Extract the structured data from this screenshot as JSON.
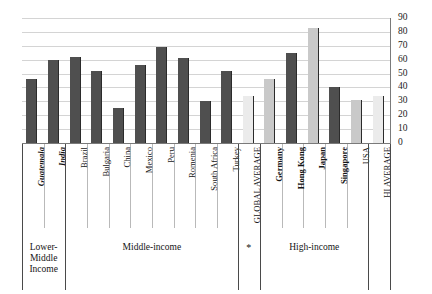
{
  "chart_data": {
    "type": "bar",
    "title": "",
    "xlabel": "",
    "ylabel": "",
    "ylim": [
      0,
      90
    ],
    "ytick_step": 10,
    "yticks": [
      90,
      80,
      70,
      60,
      50,
      40,
      30,
      20,
      10,
      0
    ],
    "grid": true,
    "legend": "none",
    "categories": [
      "Guatemala",
      "India",
      "Brazil",
      "Bulgaria",
      "China",
      "Mexico",
      "Peru",
      "Romenia",
      "South Africa",
      "Turkey",
      "GLOBAL AVERAGE",
      "Germany",
      "Hong Kong",
      "Japan",
      "Singapore",
      "USA",
      "HI AVERAGE"
    ],
    "values": [
      46,
      60,
      62,
      52,
      25,
      56,
      69,
      61,
      30,
      52,
      34,
      46,
      65,
      83,
      40,
      31,
      34
    ],
    "bars": [
      {
        "label": "Guatemala",
        "value": 46,
        "shade": "dark",
        "label_style": "bold-italic"
      },
      {
        "label": "India",
        "value": 60,
        "shade": "dark",
        "label_style": "bold-italic"
      },
      {
        "label": "Brazil",
        "value": 62,
        "shade": "dark",
        "label_style": "normal"
      },
      {
        "label": "Bulgaria",
        "value": 52,
        "shade": "dark",
        "label_style": "normal"
      },
      {
        "label": "China",
        "value": 25,
        "shade": "dark",
        "label_style": "normal"
      },
      {
        "label": "Mexico",
        "value": 56,
        "shade": "dark",
        "label_style": "normal"
      },
      {
        "label": "Peru",
        "value": 69,
        "shade": "dark",
        "label_style": "normal"
      },
      {
        "label": "Romenia",
        "value": 61,
        "shade": "dark",
        "label_style": "normal"
      },
      {
        "label": "South Africa",
        "value": 30,
        "shade": "dark",
        "label_style": "normal"
      },
      {
        "label": "Turkey",
        "value": 52,
        "shade": "dark",
        "label_style": "normal"
      },
      {
        "label": "GLOBAL AVERAGE",
        "value": 34,
        "shade": "vlight",
        "label_style": "normal"
      },
      {
        "label": "Germany",
        "value": 46,
        "shade": "light",
        "label_style": "bold"
      },
      {
        "label": "Hong Kong",
        "value": 65,
        "shade": "dark",
        "label_style": "bold"
      },
      {
        "label": "Japan",
        "value": 83,
        "shade": "light",
        "label_style": "bold"
      },
      {
        "label": "Singapore",
        "value": 40,
        "shade": "dark",
        "label_style": "bold"
      },
      {
        "label": "USA",
        "value": 31,
        "shade": "light",
        "label_style": "normal"
      },
      {
        "label": "HI AVERAGE",
        "value": 34,
        "shade": "vlight",
        "label_style": "normal"
      }
    ],
    "groups": [
      {
        "label": "Lower-\nMiddle\nIncome",
        "lines": [
          "Lower-",
          "Middle",
          "Income"
        ],
        "start": 0,
        "end": 1
      },
      {
        "label": "Middle-income",
        "lines": [
          "Middle-income"
        ],
        "start": 2,
        "end": 9
      },
      {
        "label": "High-income",
        "lines": [
          "High-income"
        ],
        "start": 11,
        "end": 15
      }
    ],
    "annotations": [
      {
        "text": "*",
        "near": "GLOBAL AVERAGE"
      }
    ],
    "colors": {
      "bar_dark": "#4f4f4f",
      "bar_light": "#c9c9c9",
      "bar_very_light": "#ebebeb",
      "bar_edge": "#2b2b2b",
      "gridline": "#d4d4d4",
      "axis": "#7a7a7a",
      "text": "#151515",
      "background": "#ffffff"
    }
  }
}
